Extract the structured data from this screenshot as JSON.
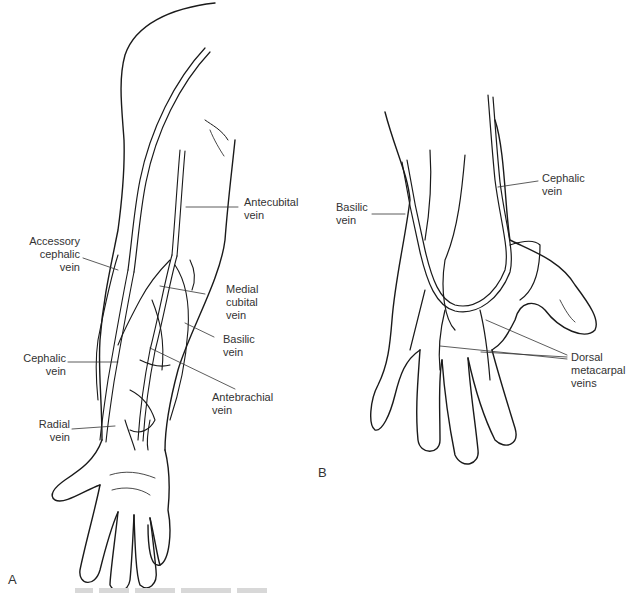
{
  "figure": {
    "panels": [
      {
        "letter": "A",
        "subject": "forearm and hand, volar view",
        "labels": [
          {
            "id": "antecubital",
            "lines": [
              "Antecubital",
              "vein"
            ]
          },
          {
            "id": "accessory-cephalic",
            "lines": [
              "Accessory",
              "cephalic",
              "vein"
            ]
          },
          {
            "id": "medial-cubital",
            "lines": [
              "Medial",
              "cubital",
              "vein"
            ]
          },
          {
            "id": "basilic",
            "lines": [
              "Basilic",
              "vein"
            ]
          },
          {
            "id": "cephalic",
            "lines": [
              "Cephalic",
              "vein"
            ]
          },
          {
            "id": "antebrachial",
            "lines": [
              "Antebrachial",
              "vein"
            ]
          },
          {
            "id": "radial",
            "lines": [
              "Radial",
              "vein"
            ]
          }
        ]
      },
      {
        "letter": "B",
        "subject": "hand, dorsal view",
        "labels": [
          {
            "id": "basilic",
            "lines": [
              "Basilic",
              "vein"
            ]
          },
          {
            "id": "cephalic",
            "lines": [
              "Cephalic",
              "vein"
            ]
          },
          {
            "id": "dorsal-metacarpal",
            "lines": [
              "Dorsal",
              "metacarpal",
              "veins"
            ]
          }
        ]
      }
    ],
    "artist_signature": "Suk",
    "colors": {
      "line": "#1a1a1a",
      "vein_fill": "#9a9a9a",
      "background": "#ffffff",
      "text": "#333333"
    }
  }
}
